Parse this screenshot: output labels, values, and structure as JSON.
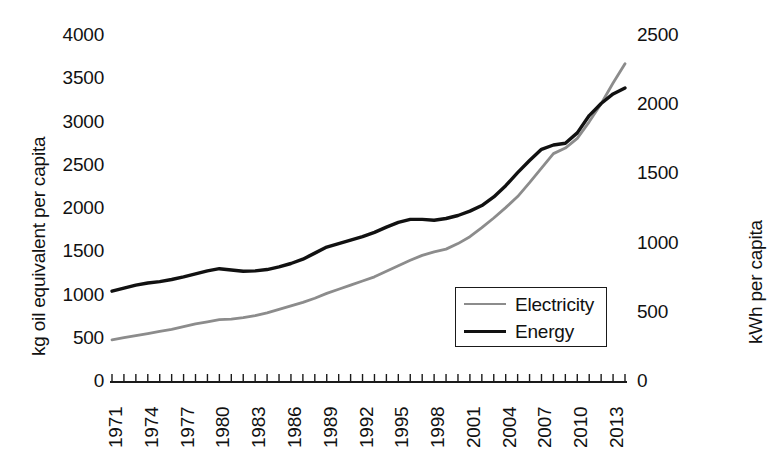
{
  "chart_data": {
    "type": "line",
    "title": "",
    "xlabel": "",
    "ylabel": "kg oil equivalent per capita",
    "ylabel_right": "kWh per capita",
    "grid": false,
    "legend_position": "inside-lower-right",
    "xlim": [
      1971,
      2014
    ],
    "ylim": [
      0,
      4000
    ],
    "ylim_right": [
      0,
      2500
    ],
    "yticks": [
      0,
      500,
      1000,
      1500,
      2000,
      2500,
      3000,
      3500,
      4000
    ],
    "yticks_right": [
      0,
      500,
      1000,
      1500,
      2000,
      2500
    ],
    "xticks_labeled": [
      1971,
      1974,
      1977,
      1980,
      1983,
      1986,
      1989,
      1992,
      1995,
      1998,
      2001,
      2004,
      2007,
      2010,
      2013
    ],
    "x": [
      1971,
      1972,
      1973,
      1974,
      1975,
      1976,
      1977,
      1978,
      1979,
      1980,
      1981,
      1982,
      1983,
      1984,
      1985,
      1986,
      1987,
      1988,
      1989,
      1990,
      1991,
      1992,
      1993,
      1994,
      1995,
      1996,
      1997,
      1998,
      1999,
      2000,
      2001,
      2002,
      2003,
      2004,
      2005,
      2006,
      2007,
      2008,
      2009,
      2010,
      2011,
      2012,
      2013,
      2014
    ],
    "series": [
      {
        "name": "Electricity",
        "axis": "right",
        "color": "#8c8c8c",
        "units": "kWh per capita",
        "values": [
          305,
          320,
          335,
          350,
          365,
          380,
          400,
          420,
          435,
          450,
          455,
          465,
          480,
          500,
          525,
          550,
          575,
          605,
          640,
          670,
          700,
          730,
          760,
          800,
          840,
          880,
          915,
          940,
          960,
          1000,
          1050,
          1115,
          1185,
          1260,
          1340,
          1440,
          1545,
          1650,
          1690,
          1760,
          1880,
          2010,
          2160,
          2300
        ]
      },
      {
        "name": "Energy",
        "axis": "left",
        "color": "#111111",
        "units": "kg oil equivalent per capita",
        "values": [
          1050,
          1085,
          1120,
          1145,
          1160,
          1185,
          1215,
          1250,
          1285,
          1310,
          1295,
          1280,
          1285,
          1300,
          1330,
          1370,
          1420,
          1490,
          1560,
          1600,
          1640,
          1680,
          1730,
          1790,
          1845,
          1880,
          1880,
          1870,
          1890,
          1925,
          1975,
          2040,
          2140,
          2270,
          2420,
          2560,
          2690,
          2740,
          2760,
          2880,
          3080,
          3220,
          3330,
          3400
        ]
      }
    ],
    "legend": [
      {
        "label": "Electricity",
        "color": "#8c8c8c"
      },
      {
        "label": "Energy",
        "color": "#111111"
      }
    ],
    "axes_geometry": {
      "plot_left": 112,
      "plot_right": 625,
      "plot_top": 36,
      "plot_bottom": 382
    }
  }
}
